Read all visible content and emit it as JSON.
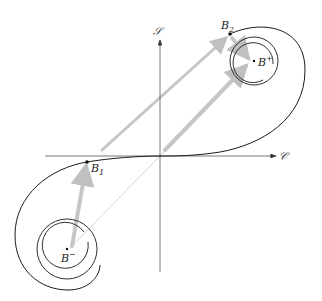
{
  "diagram": {
    "axes": {
      "vertical_label": "𝒮",
      "horizontal_label": "𝒞"
    },
    "points": [
      {
        "id": "B2",
        "label": "B",
        "subscript": "2"
      },
      {
        "id": "B1",
        "label": "B",
        "subscript": "1"
      },
      {
        "id": "Bplus",
        "label": "B",
        "superscript": "+"
      },
      {
        "id": "Bminus",
        "label": "B",
        "superscript": "−"
      }
    ],
    "colors": {
      "curve": "#1a1a1a",
      "axis": "#555555",
      "arrow": "#c8c8c8",
      "thin_line": "#cfcfcf"
    }
  }
}
